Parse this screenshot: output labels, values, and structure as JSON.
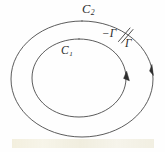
{
  "figure": {
    "kind": "math-diagram",
    "background_color": "#fefefe",
    "stroke_color": "#3a3a3a",
    "label_color": "#2b2b2b",
    "labels": {
      "outer_curve": {
        "base": "C",
        "subscript": "2",
        "full": "C₂"
      },
      "inner_curve": {
        "base": "C",
        "subscript": "1",
        "full": "C₁"
      },
      "cut_left": "−Γ",
      "cut_right": "Γ"
    },
    "curves": [
      {
        "name": "outer-curve",
        "label": "C₂",
        "shape": "ellipse",
        "cx": 82,
        "cy": 79,
        "rx": 71,
        "ry": 58,
        "orientation": "counterclockwise",
        "arrow": true
      },
      {
        "name": "inner-curve",
        "label": "C₁",
        "shape": "ellipse",
        "cx": 79,
        "cy": 78,
        "rx": 47,
        "ry": 39,
        "orientation": "counterclockwise",
        "arrow": true
      }
    ],
    "cut": {
      "name": "cut-segment",
      "left_label": "−Γ",
      "right_label": "Γ",
      "segments": 2
    }
  }
}
